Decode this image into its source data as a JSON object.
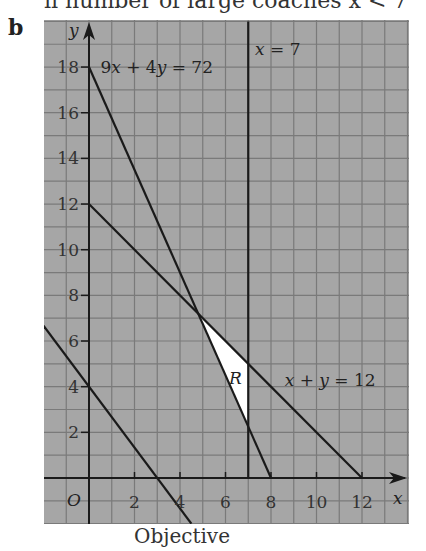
{
  "header": {
    "top_text": "ii  number of large coaches x < 7",
    "part_label": "b"
  },
  "caption": "Objective",
  "chart_data": {
    "type": "line",
    "title": "",
    "xlabel": "x",
    "ylabel": "y",
    "origin_label": "O",
    "xlim": [
      -2,
      12.5
    ],
    "ylim": [
      -2,
      20
    ],
    "grid": true,
    "x_ticks": [
      2,
      4,
      6,
      8,
      10,
      12
    ],
    "y_ticks": [
      2,
      4,
      6,
      8,
      10,
      12,
      14,
      16,
      18
    ],
    "series": [
      {
        "name": "9x + 4y = 72",
        "points": [
          [
            0,
            18
          ],
          [
            8,
            0
          ]
        ],
        "label": "9x + 4y = 72"
      },
      {
        "name": "x = 7",
        "points": [
          [
            7,
            20
          ],
          [
            7,
            0
          ]
        ],
        "label": "x = 7"
      },
      {
        "name": "x + y = 12",
        "points": [
          [
            0,
            12
          ],
          [
            12,
            0
          ]
        ],
        "label": "x + y = 12"
      },
      {
        "name": "Objective line",
        "points": [
          [
            -2,
            6.67
          ],
          [
            4.5,
            -2
          ]
        ],
        "label": ""
      }
    ],
    "feasible_region": {
      "label": "R",
      "vertices": [
        [
          4.8,
          7.2
        ],
        [
          7,
          5
        ],
        [
          7,
          2.25
        ]
      ],
      "fill": "#ffffff"
    },
    "annotations": [
      {
        "text": "9x + 4y = 72",
        "x": 0.5,
        "y": 18
      },
      {
        "text": "x = 7",
        "x": 7.3,
        "y": 18.8
      },
      {
        "text": "x + y = 12",
        "x": 8.6,
        "y": 4.3
      },
      {
        "text": "R",
        "x": 6.15,
        "y": 4.4
      }
    ]
  },
  "colors": {
    "grid_background": "#a6a6a6",
    "grid_lines": "#7a7a7a",
    "line": "#1a1a1a",
    "region": "#ffffff"
  }
}
